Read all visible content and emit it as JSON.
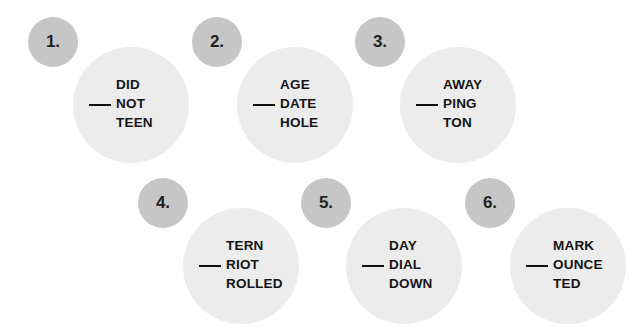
{
  "puzzles": [
    {
      "number": "1.",
      "words": [
        "DID",
        "NOT",
        "TEEN"
      ]
    },
    {
      "number": "2.",
      "words": [
        "AGE",
        "DATE",
        "HOLE"
      ]
    },
    {
      "number": "3.",
      "words": [
        "AWAY",
        "PING",
        "TON"
      ]
    },
    {
      "number": "4.",
      "words": [
        "TERN",
        "RIOT",
        "ROLLED"
      ]
    },
    {
      "number": "5.",
      "words": [
        "DAY",
        "DIAL",
        "DOWN"
      ]
    },
    {
      "number": "6.",
      "words": [
        "MARK",
        "OUNCE",
        "TED"
      ]
    }
  ],
  "colors": {
    "number_circle": "#c6c6c6",
    "word_circle": "#ececec",
    "text": "#141414"
  }
}
